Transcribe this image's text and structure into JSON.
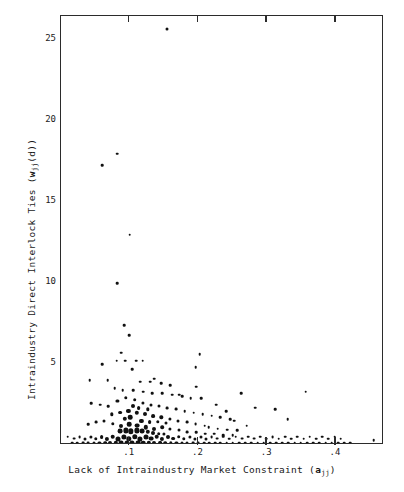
{
  "figure": {
    "background_color": "#ffffff",
    "frame_color": "#2b2b2b",
    "point_color": "#111111"
  },
  "axis_titles": {
    "x_prefix": "Lack of Intraindustry Market Constraint (",
    "x_symbol": "a",
    "x_subscript": "jj",
    "x_suffix": ")",
    "x_full": "Lack of Intraindustry Market Constraint (a_jj)",
    "y_prefix": "Intraindustry Direct Interlock Ties (",
    "y_symbol": "w",
    "y_subscript": "jj",
    "y_mid": "(d)",
    "y_suffix": ")",
    "y_full": "Intraindustry Direct Interlock Ties (w_jj(d))"
  },
  "ticks": {
    "y_labels": [
      "25",
      "20",
      "15",
      "10",
      "5"
    ],
    "y_values": [
      25,
      20,
      15,
      10,
      5
    ],
    "x_labels": [
      ".1",
      ".2",
      ".3",
      ".4"
    ],
    "x_values": [
      0.1,
      0.2,
      0.3,
      0.4
    ]
  },
  "chart_data": {
    "type": "scatter",
    "title": "",
    "xlabel": "Lack of Intraindustry Market Constraint (a_jj)",
    "ylabel": "Intraindustry Direct Interlock Ties (w_jj(d))",
    "xlim": [
      0.0,
      0.47
    ],
    "ylim": [
      0,
      26.5
    ],
    "grid": false,
    "legend": null,
    "xticks": [
      0.1,
      0.2,
      0.3,
      0.4
    ],
    "yticks": [
      5,
      10,
      15,
      20,
      25
    ],
    "marker": "filled-circle",
    "note": "Marker sizes vary; larger dots indicate overlapping/heavier observations",
    "points": [
      [
        0.154,
        25.7,
        3.0
      ],
      [
        0.06,
        17.3,
        2.6
      ],
      [
        0.082,
        18.0,
        2.6
      ],
      [
        0.1,
        13.0,
        2.6
      ],
      [
        0.082,
        10.0,
        2.6
      ],
      [
        0.092,
        7.4,
        2.6
      ],
      [
        0.099,
        6.8,
        2.6
      ],
      [
        0.088,
        5.7,
        2.6
      ],
      [
        0.081,
        5.2,
        2.6
      ],
      [
        0.093,
        5.2,
        2.6
      ],
      [
        0.109,
        5.2,
        2.6
      ],
      [
        0.119,
        5.2,
        2.6
      ],
      [
        0.104,
        4.7,
        2.6
      ],
      [
        0.06,
        5.0,
        2.6
      ],
      [
        0.202,
        5.6,
        2.6
      ],
      [
        0.196,
        4.8,
        2.6
      ],
      [
        0.197,
        3.6,
        2.6
      ],
      [
        0.262,
        3.2,
        2.6
      ],
      [
        0.172,
        3.1,
        2.6
      ],
      [
        0.136,
        4.1,
        2.6
      ],
      [
        0.068,
        4.0,
        2.6
      ],
      [
        0.042,
        4.0,
        2.6
      ],
      [
        0.115,
        3.9,
        2.6
      ],
      [
        0.13,
        3.9,
        2.6
      ],
      [
        0.146,
        3.8,
        2.6
      ],
      [
        0.159,
        3.7,
        2.6
      ],
      [
        0.078,
        3.5,
        2.6
      ],
      [
        0.09,
        3.4,
        2.6
      ],
      [
        0.105,
        3.4,
        2.6
      ],
      [
        0.12,
        3.3,
        2.6
      ],
      [
        0.133,
        3.2,
        2.6
      ],
      [
        0.147,
        3.2,
        2.6
      ],
      [
        0.162,
        3.1,
        2.6
      ],
      [
        0.176,
        3.0,
        2.6
      ],
      [
        0.189,
        2.9,
        2.6
      ],
      [
        0.204,
        2.9,
        2.6
      ],
      [
        0.356,
        3.3,
        2.6
      ],
      [
        0.283,
        2.3,
        2.6
      ],
      [
        0.312,
        2.2,
        2.6
      ],
      [
        0.33,
        1.6,
        2.6
      ],
      [
        0.044,
        2.6,
        2.6
      ],
      [
        0.057,
        2.5,
        2.6
      ],
      [
        0.069,
        2.4,
        2.6
      ],
      [
        0.082,
        2.7,
        3.2
      ],
      [
        0.094,
        2.9,
        3.4
      ],
      [
        0.107,
        2.8,
        3.6
      ],
      [
        0.119,
        2.6,
        3.2
      ],
      [
        0.131,
        2.5,
        3.0
      ],
      [
        0.143,
        2.4,
        3.0
      ],
      [
        0.154,
        2.3,
        2.8
      ],
      [
        0.167,
        2.2,
        2.8
      ],
      [
        0.18,
        2.1,
        2.6
      ],
      [
        0.193,
        2.0,
        2.6
      ],
      [
        0.206,
        1.9,
        2.6
      ],
      [
        0.219,
        1.8,
        2.6
      ],
      [
        0.232,
        1.7,
        2.6
      ],
      [
        0.246,
        1.6,
        2.6
      ],
      [
        0.074,
        1.9,
        3.4
      ],
      [
        0.086,
        2.0,
        3.8
      ],
      [
        0.098,
        2.1,
        4.2
      ],
      [
        0.11,
        2.0,
        4.4
      ],
      [
        0.122,
        1.9,
        4.0
      ],
      [
        0.134,
        1.8,
        3.8
      ],
      [
        0.146,
        1.7,
        3.4
      ],
      [
        0.158,
        1.6,
        3.2
      ],
      [
        0.17,
        1.5,
        3.0
      ],
      [
        0.183,
        1.4,
        2.8
      ],
      [
        0.196,
        1.3,
        2.8
      ],
      [
        0.209,
        1.2,
        2.6
      ],
      [
        0.04,
        1.3,
        2.6
      ],
      [
        0.051,
        1.4,
        2.8
      ],
      [
        0.063,
        1.5,
        3.0
      ],
      [
        0.075,
        1.3,
        3.4
      ],
      [
        0.087,
        1.2,
        4.0
      ],
      [
        0.099,
        1.3,
        4.6
      ],
      [
        0.111,
        1.2,
        4.8
      ],
      [
        0.123,
        1.1,
        4.4
      ],
      [
        0.135,
        1.0,
        4.0
      ],
      [
        0.147,
        1.1,
        3.6
      ],
      [
        0.159,
        1.0,
        3.2
      ],
      [
        0.171,
        0.9,
        3.0
      ],
      [
        0.184,
        0.8,
        2.8
      ],
      [
        0.197,
        0.8,
        2.6
      ],
      [
        0.21,
        0.7,
        2.6
      ],
      [
        0.223,
        0.7,
        2.6
      ],
      [
        0.236,
        0.6,
        2.6
      ],
      [
        0.25,
        0.6,
        2.6
      ],
      [
        0.01,
        0.5,
        2.6
      ],
      [
        0.019,
        0.4,
        2.8
      ],
      [
        0.027,
        0.5,
        2.8
      ],
      [
        0.035,
        0.4,
        3.0
      ],
      [
        0.043,
        0.5,
        3.2
      ],
      [
        0.051,
        0.4,
        3.4
      ],
      [
        0.059,
        0.5,
        3.8
      ],
      [
        0.067,
        0.4,
        4.2
      ],
      [
        0.075,
        0.5,
        4.6
      ],
      [
        0.083,
        0.4,
        5.0
      ],
      [
        0.091,
        0.5,
        5.2
      ],
      [
        0.099,
        0.4,
        5.4
      ],
      [
        0.107,
        0.5,
        5.4
      ],
      [
        0.115,
        0.4,
        5.2
      ],
      [
        0.123,
        0.5,
        5.0
      ],
      [
        0.131,
        0.4,
        4.8
      ],
      [
        0.139,
        0.5,
        4.6
      ],
      [
        0.147,
        0.4,
        4.2
      ],
      [
        0.155,
        0.5,
        4.0
      ],
      [
        0.163,
        0.4,
        3.8
      ],
      [
        0.171,
        0.5,
        3.6
      ],
      [
        0.179,
        0.4,
        3.4
      ],
      [
        0.187,
        0.5,
        3.2
      ],
      [
        0.195,
        0.4,
        3.2
      ],
      [
        0.203,
        0.5,
        3.0
      ],
      [
        0.211,
        0.4,
        3.0
      ],
      [
        0.219,
        0.5,
        2.8
      ],
      [
        0.227,
        0.4,
        2.8
      ],
      [
        0.236,
        0.5,
        2.6
      ],
      [
        0.245,
        0.4,
        2.6
      ],
      [
        0.254,
        0.5,
        2.6
      ],
      [
        0.263,
        0.4,
        2.8
      ],
      [
        0.272,
        0.5,
        2.6
      ],
      [
        0.281,
        0.4,
        2.8
      ],
      [
        0.29,
        0.5,
        2.6
      ],
      [
        0.299,
        0.4,
        2.6
      ],
      [
        0.308,
        0.5,
        2.8
      ],
      [
        0.317,
        0.4,
        2.6
      ],
      [
        0.326,
        0.5,
        2.6
      ],
      [
        0.335,
        0.4,
        2.6
      ],
      [
        0.344,
        0.5,
        2.6
      ],
      [
        0.353,
        0.4,
        2.6
      ],
      [
        0.362,
        0.5,
        2.6
      ],
      [
        0.371,
        0.4,
        2.6
      ],
      [
        0.38,
        0.5,
        2.6
      ],
      [
        0.389,
        0.4,
        2.6
      ],
      [
        0.398,
        0.5,
        2.6
      ],
      [
        0.407,
        0.4,
        2.6
      ],
      [
        0.455,
        0.3,
        2.6
      ],
      [
        0.016,
        0.15,
        2.6
      ],
      [
        0.024,
        0.12,
        2.6
      ],
      [
        0.032,
        0.15,
        2.8
      ],
      [
        0.04,
        0.12,
        2.8
      ],
      [
        0.048,
        0.15,
        3.0
      ],
      [
        0.056,
        0.12,
        3.2
      ],
      [
        0.064,
        0.15,
        3.6
      ],
      [
        0.072,
        0.12,
        4.0
      ],
      [
        0.08,
        0.15,
        4.4
      ],
      [
        0.088,
        0.12,
        4.8
      ],
      [
        0.096,
        0.15,
        5.0
      ],
      [
        0.104,
        0.12,
        5.0
      ],
      [
        0.112,
        0.15,
        4.8
      ],
      [
        0.12,
        0.12,
        4.6
      ],
      [
        0.128,
        0.15,
        4.4
      ],
      [
        0.136,
        0.12,
        4.0
      ],
      [
        0.144,
        0.15,
        3.8
      ],
      [
        0.152,
        0.12,
        3.6
      ],
      [
        0.16,
        0.15,
        3.4
      ],
      [
        0.168,
        0.12,
        3.2
      ],
      [
        0.176,
        0.15,
        3.0
      ],
      [
        0.184,
        0.12,
        3.0
      ],
      [
        0.192,
        0.15,
        2.8
      ],
      [
        0.2,
        0.12,
        2.8
      ],
      [
        0.208,
        0.15,
        2.6
      ],
      [
        0.216,
        0.12,
        2.6
      ],
      [
        0.224,
        0.15,
        2.6
      ],
      [
        0.232,
        0.12,
        2.6
      ],
      [
        0.241,
        0.15,
        2.6
      ],
      [
        0.25,
        0.12,
        2.6
      ],
      [
        0.259,
        0.15,
        2.6
      ],
      [
        0.268,
        0.12,
        2.6
      ],
      [
        0.277,
        0.15,
        2.6
      ],
      [
        0.286,
        0.12,
        2.6
      ],
      [
        0.295,
        0.15,
        2.6
      ],
      [
        0.304,
        0.12,
        2.6
      ],
      [
        0.313,
        0.15,
        2.6
      ],
      [
        0.322,
        0.12,
        2.6
      ],
      [
        0.331,
        0.15,
        2.6
      ],
      [
        0.34,
        0.12,
        2.6
      ],
      [
        0.349,
        0.15,
        2.6
      ],
      [
        0.358,
        0.12,
        2.6
      ],
      [
        0.367,
        0.15,
        2.6
      ],
      [
        0.376,
        0.12,
        2.6
      ],
      [
        0.385,
        0.15,
        2.6
      ],
      [
        0.394,
        0.12,
        2.6
      ],
      [
        0.403,
        0.15,
        2.6
      ],
      [
        0.412,
        0.12,
        2.6
      ],
      [
        0.421,
        0.15,
        2.6
      ],
      [
        0.105,
        2.4,
        4.0
      ],
      [
        0.113,
        2.3,
        3.8
      ],
      [
        0.126,
        2.2,
        3.4
      ],
      [
        0.093,
        1.6,
        4.4
      ],
      [
        0.101,
        1.7,
        4.6
      ],
      [
        0.117,
        1.5,
        4.2
      ],
      [
        0.129,
        1.4,
        3.8
      ],
      [
        0.141,
        1.45,
        3.4
      ],
      [
        0.153,
        1.35,
        3.0
      ],
      [
        0.086,
        0.85,
        4.8
      ],
      [
        0.094,
        0.9,
        5.2
      ],
      [
        0.102,
        0.85,
        5.4
      ],
      [
        0.11,
        0.9,
        5.2
      ],
      [
        0.118,
        0.85,
        4.8
      ],
      [
        0.126,
        0.8,
        4.4
      ],
      [
        0.134,
        0.75,
        4.0
      ],
      [
        0.142,
        0.7,
        3.6
      ],
      [
        0.15,
        0.7,
        3.2
      ],
      [
        0.215,
        1.1,
        2.6
      ],
      [
        0.228,
        1.0,
        2.6
      ],
      [
        0.242,
        0.95,
        2.6
      ],
      [
        0.256,
        0.9,
        2.6
      ],
      [
        0.27,
        1.2,
        2.6
      ],
      [
        0.24,
        2.1,
        2.6
      ],
      [
        0.226,
        2.5,
        2.6
      ],
      [
        0.252,
        1.5,
        2.6
      ]
    ]
  }
}
